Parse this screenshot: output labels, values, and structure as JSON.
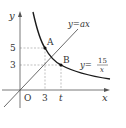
{
  "diagram": {
    "type": "coordinate-graph",
    "axes": {
      "x_label": "x",
      "y_label": "y",
      "origin_label": "O"
    },
    "ticks": {
      "x": [
        "3",
        "t"
      ],
      "y": [
        "5",
        "3"
      ]
    },
    "points": [
      {
        "label": "A",
        "x": "3",
        "y": "5"
      },
      {
        "label": "B",
        "x": "t",
        "y": "3"
      }
    ],
    "curves": [
      {
        "name": "line",
        "label_lhs": "y=",
        "label_rhs": "ax"
      },
      {
        "name": "hyperbola",
        "label_lhs": "y=",
        "numerator": "15",
        "denominator": "x"
      }
    ],
    "colors": {
      "axis": "#555555",
      "curve": "#1a1a1a",
      "line": "#444444",
      "dashed": "#888888",
      "text": "#333333"
    }
  }
}
